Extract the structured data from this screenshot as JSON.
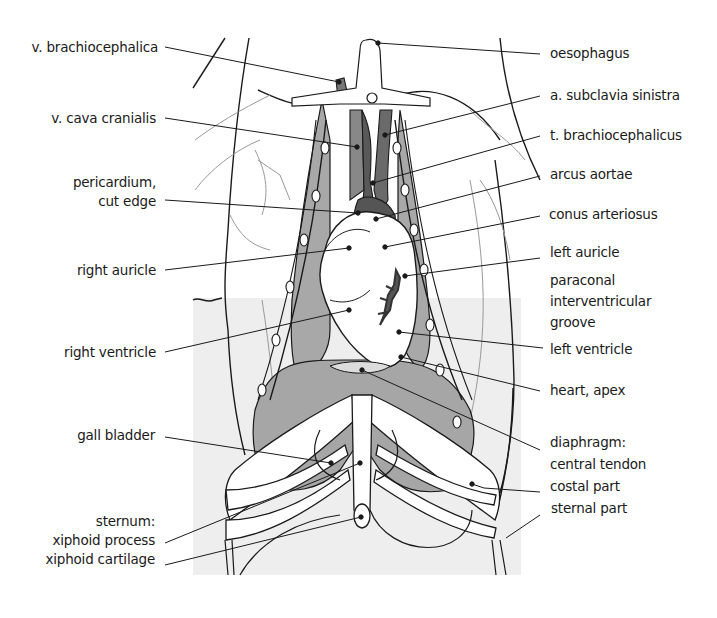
{
  "figure": {
    "colors": {
      "background": "#ffffff",
      "panel_gray": "#ededed",
      "lung_gray": "#a9a9a9",
      "vessel_dark": "#5a5a5a",
      "vessel_mid": "#8c8c8c",
      "line": "#1a1a1a"
    }
  },
  "labels_left": [
    {
      "id": "v-brachiocephalica",
      "lines": [
        "v. brachiocephalica"
      ],
      "x_right": 158,
      "y": 38,
      "target": [
        340,
        82
      ]
    },
    {
      "id": "v-cava-cranialis",
      "lines": [
        "v. cava cranialis"
      ],
      "x_right": 156,
      "y": 110,
      "target": [
        357,
        147
      ]
    },
    {
      "id": "pericardium-cut-edge",
      "lines": [
        "pericardium,",
        "cut edge"
      ],
      "x_right": 156,
      "y": 176,
      "target": [
        358,
        213
      ]
    },
    {
      "id": "right-auricle",
      "lines": [
        "right auricle"
      ],
      "x_right": 156,
      "y": 261,
      "target": [
        349,
        248
      ]
    },
    {
      "id": "right-ventricle",
      "lines": [
        "right ventricle"
      ],
      "x_right": 156,
      "y": 343,
      "target": [
        349,
        310
      ]
    },
    {
      "id": "gall-bladder",
      "lines": [
        "gall bladder"
      ],
      "x_right": 155,
      "y": 427,
      "target": [
        331,
        463
      ]
    },
    {
      "id": "sternum",
      "lines": [
        "sternum:",
        "xiphoid process",
        "xiphoid cartilage"
      ],
      "x_right": 155,
      "y": 510,
      "targets": [
        [
          360,
          463
        ],
        [
          361,
          517
        ]
      ]
    }
  ],
  "labels_right": [
    {
      "id": "oesophagus",
      "lines": [
        "oesophagus"
      ],
      "x": 550,
      "y": 43,
      "target": [
        378,
        43
      ]
    },
    {
      "id": "a-subclavia-sinistra",
      "lines": [
        "a. subclavia sinistra"
      ],
      "x": 550,
      "y": 87,
      "target": [
        385,
        135
      ]
    },
    {
      "id": "t-brachiocephalicus",
      "lines": [
        "t. brachiocephalicus"
      ],
      "x": 550,
      "y": 127,
      "target": [
        373,
        183
      ]
    },
    {
      "id": "arcus-aortae",
      "lines": [
        "arcus aortae"
      ],
      "x": 550,
      "y": 166,
      "target": [
        376,
        219
      ]
    },
    {
      "id": "conus-arteriosus",
      "lines": [
        "conus arteriosus"
      ],
      "x": 550,
      "y": 206,
      "target": [
        385,
        247
      ]
    },
    {
      "id": "left-auricle",
      "lines": [
        "left auricle"
      ],
      "x": 550,
      "y": 244,
      "target": [
        405,
        276
      ]
    },
    {
      "id": "paraconal-interventricular-groove",
      "lines": [
        "paraconal",
        "interventricular",
        "groove"
      ],
      "x": 550,
      "y": 271
    },
    {
      "id": "left-ventricle",
      "lines": [
        "left ventricle"
      ],
      "x": 550,
      "y": 341,
      "target": [
        399,
        332
      ]
    },
    {
      "id": "heart-apex",
      "lines": [
        "heart, apex"
      ],
      "x": 550,
      "y": 382,
      "target": [
        401,
        357
      ]
    },
    {
      "id": "diaphragm",
      "lines": [
        "diaphragm:",
        "central tendon",
        "costal part",
        "sternal part"
      ],
      "x": 550,
      "y": 432,
      "targets": [
        [
          362,
          370
        ],
        [
          478,
          484
        ],
        [
          484,
          506
        ]
      ]
    }
  ],
  "attribution_text": ""
}
